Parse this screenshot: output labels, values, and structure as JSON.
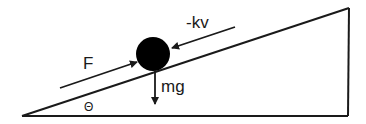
{
  "diagram": {
    "labels": {
      "applied_force": "F",
      "drag_force": "-kv",
      "weight": "mg",
      "angle": "Θ"
    },
    "colors": {
      "stroke": "#1a1a1a",
      "ball": "#000000",
      "background": "#ffffff"
    },
    "incline": {
      "left_vertex": [
        22,
        116
      ],
      "top_right": [
        349,
        8
      ],
      "bottom_right": [
        348,
        116
      ]
    },
    "ball": {
      "cx": 153,
      "cy": 54,
      "r": 17
    }
  }
}
